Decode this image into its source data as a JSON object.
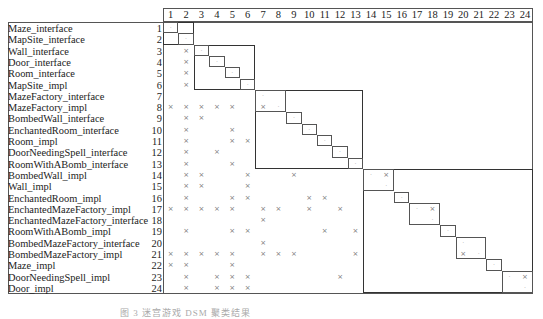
{
  "figure": {
    "type": "design-structure-matrix",
    "columns": [
      "1",
      "2",
      "3",
      "4",
      "5",
      "6",
      "7",
      "8",
      "9",
      "10",
      "11",
      "12",
      "13",
      "14",
      "15",
      "16",
      "17",
      "18",
      "19",
      "20",
      "21",
      "22",
      "23",
      "24"
    ],
    "rows": [
      {
        "num": "1",
        "label": "Maze_interface",
        "deps": []
      },
      {
        "num": "2",
        "label": "MapSite_interface",
        "deps": []
      },
      {
        "num": "3",
        "label": "Wall_interface",
        "deps": [
          2
        ]
      },
      {
        "num": "4",
        "label": "Door_interface",
        "deps": [
          2
        ]
      },
      {
        "num": "5",
        "label": "Room_interface",
        "deps": [
          2
        ]
      },
      {
        "num": "6",
        "label": "MapSite_impl",
        "deps": [
          2
        ]
      },
      {
        "num": "7",
        "label": "MazeFactory_interface",
        "deps": []
      },
      {
        "num": "8",
        "label": "MazeFactory_impl",
        "deps": [
          1,
          2,
          3,
          4,
          5,
          7
        ]
      },
      {
        "num": "9",
        "label": "BombedWall_interface",
        "deps": [
          2,
          3
        ]
      },
      {
        "num": "10",
        "label": "EnchantedRoom_interface",
        "deps": [
          2,
          5
        ]
      },
      {
        "num": "11",
        "label": "Room_impl",
        "deps": [
          2,
          5,
          6
        ]
      },
      {
        "num": "12",
        "label": "DoorNeedingSpell_interface",
        "deps": [
          2,
          4
        ]
      },
      {
        "num": "13",
        "label": "RoomWithABomb_interface",
        "deps": [
          2,
          5
        ]
      },
      {
        "num": "14",
        "label": "BombedWall_impl",
        "deps": [
          2,
          3,
          6,
          9,
          15
        ]
      },
      {
        "num": "15",
        "label": "Wall_impl",
        "deps": [
          2,
          3,
          6
        ]
      },
      {
        "num": "16",
        "label": "EnchantedRoom_impl",
        "deps": [
          2,
          5,
          6,
          10,
          11
        ]
      },
      {
        "num": "17",
        "label": "EnchantedMazeFactory_impl",
        "deps": [
          1,
          2,
          3,
          4,
          5,
          7,
          8,
          10,
          12,
          18
        ]
      },
      {
        "num": "18",
        "label": "EnchantedMazeFactory_interface",
        "deps": [
          7
        ]
      },
      {
        "num": "19",
        "label": "RoomWithABomb_impl",
        "deps": [
          2,
          5,
          6,
          11,
          13
        ]
      },
      {
        "num": "20",
        "label": "BombedMazeFactory_interface",
        "deps": [
          7
        ]
      },
      {
        "num": "21",
        "label": "BombedMazeFactory_impl",
        "deps": [
          1,
          2,
          3,
          4,
          5,
          7,
          8,
          9,
          13,
          20
        ]
      },
      {
        "num": "22",
        "label": "Maze_impl",
        "deps": [
          1,
          2,
          5
        ]
      },
      {
        "num": "23",
        "label": "DoorNeedingSpell_impl",
        "deps": [
          2,
          4,
          5,
          6,
          12,
          24
        ]
      },
      {
        "num": "24",
        "label": "Door_impl",
        "deps": [
          2,
          4,
          5,
          6
        ]
      }
    ],
    "dependency_mark": "×",
    "diagonal_mark": "·",
    "blocks": [
      {
        "from": 1,
        "to": 2,
        "subs": [
          [
            1,
            1
          ],
          [
            2,
            2
          ]
        ]
      },
      {
        "from": 3,
        "to": 6,
        "subs": [
          [
            3,
            3
          ],
          [
            4,
            4
          ],
          [
            5,
            5
          ],
          [
            6,
            6
          ]
        ]
      },
      {
        "from": 7,
        "to": 13,
        "subs": [
          [
            7,
            8
          ],
          [
            9,
            9
          ],
          [
            10,
            10
          ],
          [
            11,
            11
          ],
          [
            12,
            12
          ],
          [
            13,
            13
          ]
        ]
      },
      {
        "from": 14,
        "to": 24,
        "subs": [
          [
            14,
            15
          ],
          [
            16,
            16
          ],
          [
            17,
            18
          ],
          [
            19,
            19
          ],
          [
            20,
            21
          ],
          [
            22,
            22
          ],
          [
            23,
            24
          ]
        ]
      }
    ],
    "caption": "图 3   迷宫游戏 DSM 聚类结果"
  }
}
